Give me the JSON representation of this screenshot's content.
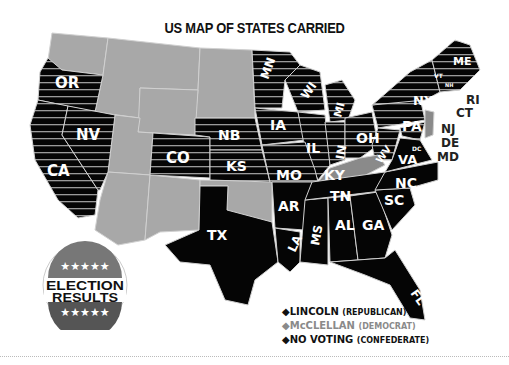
{
  "title": "US MAP OF STATES CARRIED",
  "colors": {
    "lincoln": "#000000",
    "mcclellan": "#8a8a8a",
    "no_voting": "#000000",
    "non_state": "#a8a8a8",
    "stripe": "#9a9a9a"
  },
  "legend": {
    "items": [
      {
        "bullet": "◆",
        "name": "LINCOLN",
        "party": "(REPUBLICAN)",
        "color": "#111111"
      },
      {
        "bullet": "◆",
        "name": "McCLELLAN",
        "party": "(DEMOCRAT)",
        "color": "#8a8a8a"
      },
      {
        "bullet": "◆",
        "name": "NO VOTING",
        "party": "(CONFEDERATE)",
        "color": "#111111"
      }
    ]
  },
  "badge": {
    "line1": "ELECTION",
    "line2": "RESULTS",
    "stars": "★★★★★"
  },
  "states": {
    "lincoln": [
      "OR",
      "CA",
      "NV",
      "KS",
      "MN",
      "WI",
      "IA",
      "MI",
      "IL",
      "IN",
      "OH",
      "MO",
      "PA",
      "NY",
      "WV",
      "MD",
      "ME",
      "VT",
      "NH",
      "MA",
      "RI",
      "CT"
    ],
    "mcclellan": [
      "KY",
      "NJ",
      "DE"
    ],
    "no_voting": [
      "TX",
      "AR",
      "LA",
      "MS",
      "AL",
      "GA",
      "FL",
      "TN",
      "SC",
      "NC",
      "VA"
    ],
    "labels": {
      "OR": "OR",
      "NV": "NV",
      "CA": "CA",
      "CO": "CO",
      "NB": "NB",
      "KS": "KS",
      "MN": "MN",
      "WI": "WI",
      "IA": "IA",
      "MI": "MI",
      "IL": "IL",
      "IN": "IN",
      "OH": "OH",
      "MO": "MO",
      "KY": "KY",
      "WV": "WV",
      "VA": "VA",
      "PA": "PA",
      "NY": "NY",
      "ME": "ME",
      "VT": "VT",
      "NH": "NH",
      "MA": "MA",
      "RI": "RI",
      "CT": "CT",
      "NJ": "NJ",
      "DE": "DE",
      "MD": "MD",
      "DC": "DC",
      "TX": "TX",
      "AR": "AR",
      "LA": "LA",
      "MS": "MS",
      "AL": "AL",
      "GA": "GA",
      "TN": "TN",
      "NC": "NC",
      "SC": "SC",
      "FL": "FL"
    }
  }
}
